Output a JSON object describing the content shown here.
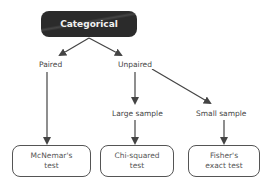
{
  "root": {
    "label": "Categorical"
  },
  "branches": {
    "paired": "Paired",
    "unpaired": "Unpaired",
    "large_sample": "Large sample",
    "small_sample": "Small sample"
  },
  "leaves": [
    {
      "line1": "McNemar's",
      "line2": "test"
    },
    {
      "line1": "Chi-squared",
      "line2": "test"
    },
    {
      "line1": "Fisher's",
      "line2": "exact test"
    }
  ],
  "colors": {
    "root_fill": "#2b2b2b",
    "root_text": "#f2f2f2",
    "edge": "#444444",
    "leaf_border": "#555555"
  }
}
